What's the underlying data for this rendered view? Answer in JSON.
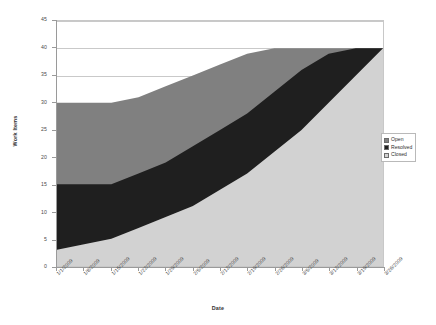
{
  "chart_data": {
    "type": "area",
    "stacked": true,
    "title": "",
    "xlabel": "Date",
    "ylabel": "Work Items",
    "ylim": [
      0,
      45
    ],
    "yticks": [
      0,
      5,
      10,
      15,
      20,
      25,
      30,
      35,
      40,
      45
    ],
    "grid": true,
    "legend_position": "right",
    "categories": [
      "1/1/2009",
      "1/8/2009",
      "1/15/2009",
      "1/22/2009",
      "1/29/2009",
      "2/5/2009",
      "2/12/2009",
      "2/19/2009",
      "2/26/2009",
      "3/5/2009",
      "3/12/2009",
      "3/19/2009",
      "3/26/2009"
    ],
    "series": [
      {
        "name": "Closed",
        "color": "#d2d2d2",
        "values": [
          3,
          4,
          5,
          7,
          9,
          11,
          14,
          17,
          21,
          25,
          30,
          35,
          40
        ],
        "cumulative_top": [
          3,
          4,
          5,
          7,
          9,
          11,
          14,
          17,
          21,
          25,
          30,
          35,
          40
        ]
      },
      {
        "name": "Resolved",
        "color": "#1f1f1f",
        "values": [
          12,
          11,
          10,
          10,
          10,
          11,
          11,
          11,
          11,
          11,
          9,
          5,
          0
        ],
        "cumulative_top": [
          15,
          15,
          15,
          17,
          19,
          22,
          25,
          28,
          32,
          36,
          39,
          40,
          40
        ]
      },
      {
        "name": "Open",
        "color": "#808080",
        "values": [
          15,
          15,
          15,
          14,
          14,
          13,
          12,
          11,
          8,
          4,
          1,
          0,
          0
        ],
        "cumulative_top": [
          30,
          30,
          30,
          31,
          33,
          35,
          37,
          39,
          40,
          40,
          40,
          40,
          40
        ]
      }
    ]
  },
  "legend": {
    "items": [
      {
        "label": "Open",
        "color": "#808080"
      },
      {
        "label": "Resolved",
        "color": "#1f1f1f"
      },
      {
        "label": "Closed",
        "color": "#d2d2d2"
      }
    ]
  }
}
